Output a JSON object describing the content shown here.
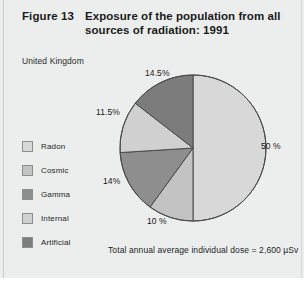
{
  "figure": {
    "number": "Figure 13",
    "title": "Exposure of the population from all sources of radiation: 1991",
    "subtitle": "United Kingdom",
    "footnote": "Total annual average individual dose = 2,600 µSv"
  },
  "legend": {
    "items": [
      {
        "label": "Radon",
        "color": "#d7d8d7"
      },
      {
        "label": "Cosmic",
        "color": "#c2c3c2"
      },
      {
        "label": "Gamma",
        "color": "#8d8e8d"
      },
      {
        "label": "Internal",
        "color": "#cfd0cf"
      },
      {
        "label": "Artificial",
        "color": "#7b7c7b"
      }
    ]
  },
  "labels": {
    "radon": "50 %",
    "cosmic": "10 %",
    "gamma": "14%",
    "internal": "11.5%",
    "artificial": "14.5%"
  },
  "chart_data": {
    "type": "pie",
    "title": "Exposure of the population from all sources of radiation: 1991",
    "subtitle": "United Kingdom",
    "unit": "percent of total annual average individual dose",
    "total_annual_average_individual_dose": "2,600 µSv",
    "start_angle_deg": 0,
    "direction": "clockwise",
    "categories": [
      "Radon",
      "Cosmic",
      "Gamma",
      "Internal",
      "Artificial"
    ],
    "values": [
      50,
      10,
      14,
      11.5,
      14.5
    ],
    "value_labels": [
      "50 %",
      "10 %",
      "14%",
      "11.5%",
      "14.5%"
    ],
    "colors": [
      "#d7d8d7",
      "#c2c3c2",
      "#8d8e8d",
      "#cfd0cf",
      "#7b7c7b"
    ],
    "legend_position": "left",
    "grid": false
  }
}
